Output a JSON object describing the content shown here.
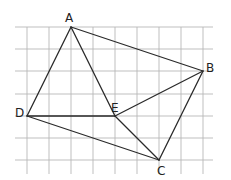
{
  "diagram": {
    "type": "geometry-grid",
    "grid": {
      "columns_x": [
        27,
        49,
        71,
        93,
        115,
        137,
        159,
        181,
        203
      ],
      "rows_y": [
        27,
        49,
        71,
        94,
        116,
        138,
        160
      ],
      "x_extent": [
        15,
        213
      ],
      "y_extent": [
        27,
        174
      ],
      "line_color": "#b8b8b8"
    },
    "points": {
      "A": {
        "label": "A",
        "x": 71,
        "y": 27,
        "grid": [
          2,
          0
        ]
      },
      "B": {
        "label": "B",
        "x": 203,
        "y": 71,
        "grid": [
          8,
          2
        ]
      },
      "C": {
        "label": "C",
        "x": 159,
        "y": 160,
        "grid": [
          6,
          6
        ]
      },
      "D": {
        "label": "D",
        "x": 27,
        "y": 116,
        "grid": [
          0,
          4
        ]
      },
      "E": {
        "label": "E",
        "x": 115,
        "y": 116,
        "grid": [
          4,
          4
        ]
      }
    },
    "segments": [
      [
        "A",
        "B"
      ],
      [
        "B",
        "C"
      ],
      [
        "C",
        "D"
      ],
      [
        "D",
        "A"
      ],
      [
        "A",
        "E"
      ],
      [
        "E",
        "C"
      ],
      [
        "D",
        "E"
      ],
      [
        "E",
        "B"
      ]
    ],
    "line_color": "#2a2a2a"
  }
}
